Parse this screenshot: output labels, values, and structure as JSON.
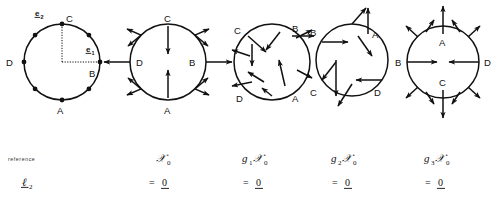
{
  "figure": {
    "title_present": false,
    "panel_count": 5,
    "vertex_labels": [
      "A",
      "B",
      "C",
      "D"
    ],
    "basis_vectors": [
      {
        "name": "e1",
        "letter": "e",
        "subscript": "1",
        "underlined": true,
        "direction": "right"
      },
      {
        "name": "e2",
        "letter": "e",
        "subscript": "2",
        "underlined": true,
        "direction": "up"
      }
    ],
    "panels": [
      {
        "id": "reference",
        "cx": 62,
        "cy": 62,
        "r": 38,
        "label_positions": {
          "A": "bottom",
          "B": "right",
          "C": "top",
          "D": "left"
        },
        "has_axes": true,
        "has_arrows": false,
        "node_count": 8,
        "caption_top": "",
        "caption_bottom": ""
      },
      {
        "id": "x0",
        "cx": 168,
        "cy": 62,
        "r": 38,
        "label_positions": {
          "A": "bottom-inside",
          "B": "right-inside",
          "C": "top-inside",
          "D": "left-inside"
        },
        "has_axes": false,
        "has_arrows": true,
        "rotation": 0,
        "pattern": "B,D outward horizontal; A,C inward vertical; diagonals outward"
      },
      {
        "id": "g1x0",
        "cx": 272,
        "cy": 62,
        "r": 38,
        "label_positions": {
          "A": "bottom-right",
          "B": "top-right",
          "C": "top-left",
          "D": "bottom-left"
        },
        "has_axes": false,
        "has_arrows": true,
        "rotation": 45,
        "pattern": "rotated 45 degrees"
      },
      {
        "id": "g2x0",
        "cx": 352,
        "cy": 60,
        "r": 38,
        "label_positions": {
          "A": "top-right",
          "B": "top-left",
          "C": "bottom-left",
          "D": "bottom-right"
        },
        "has_axes": false,
        "has_arrows": true,
        "rotation": 90,
        "pattern": "rotated 90 degrees"
      },
      {
        "id": "g3x0",
        "cx": 443,
        "cy": 62,
        "r": 38,
        "label_positions": {
          "A": "top-inside",
          "B": "left-inside",
          "C": "bottom-inside",
          "D": "right-inside"
        },
        "has_axes": false,
        "has_arrows": true,
        "rotation": 135,
        "pattern": "B,D inward horizontal; A,C outward vertical; diagonals outward"
      }
    ],
    "captions": [
      {
        "id": "reference",
        "top": "reference",
        "bottom_letter": "ℓ",
        "bottom_sub": "2",
        "bottom_underlined": true,
        "x": 40
      },
      {
        "id": "x0",
        "top_letter": "𝒳",
        "top_sub": "0",
        "bottom": "= 0",
        "bottom_underlined": true,
        "x": 178
      },
      {
        "id": "g1x0",
        "top_letter": "g",
        "top_sub": "1",
        "top_var": "𝒳",
        "top_var_sub": "0",
        "bottom": "= 0",
        "bottom_underlined": true,
        "x": 268
      },
      {
        "id": "g2x0",
        "top_letter": "g",
        "top_sub": "2",
        "top_var": "𝒳",
        "top_var_sub": "0",
        "bottom": "= 0",
        "bottom_underlined": true,
        "x": 348
      },
      {
        "id": "g3x0",
        "top_letter": "g",
        "top_sub": "3",
        "top_var": "𝒳",
        "top_var_sub": "0",
        "bottom": "= 0",
        "bottom_underlined": true,
        "x": 428
      }
    ],
    "colors": {
      "ink": "#111111",
      "background": "#ffffff"
    }
  },
  "captions_text": {
    "reference_word": "reference",
    "ell": "ℓ",
    "ell_sub": "2",
    "x0_var": "𝒳",
    "x0_sub": "0",
    "g": "g",
    "g1_sub": "1",
    "g2_sub": "2",
    "g3_sub": "3",
    "equals_zero": "= 0",
    "zero": "0",
    "equals": "="
  },
  "vertices": {
    "A": "A",
    "B": "B",
    "C": "C",
    "D": "D"
  },
  "basis": {
    "e": "e",
    "one": "1",
    "two": "2"
  }
}
